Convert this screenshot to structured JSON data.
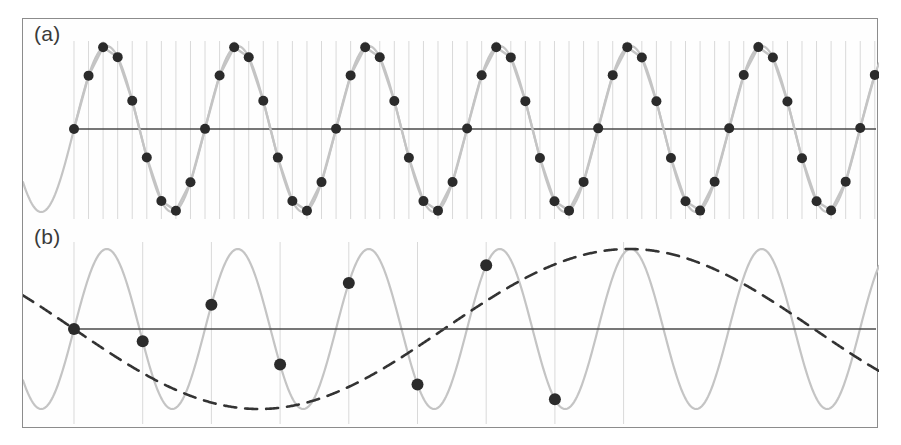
{
  "figure": {
    "width": 901,
    "height": 445,
    "background_color": "#ffffff",
    "frame_color": "#8c8c8c"
  },
  "panels": [
    {
      "id": "a",
      "label": "(a)",
      "description": "Adequately sampled sinusoid: dense sample grid, dots follow the underlying wave"
    },
    {
      "id": "b",
      "label": "(b)",
      "description": "Undersampled sinusoid: sparse sample grid, dots trace an aliased low-frequency dashed curve"
    }
  ],
  "style": {
    "signal_color": "#c4c4c4",
    "sample_dot_color": "#2b2b2b",
    "axis_color": "#4a4a4a",
    "gridline_color": "#d9d9d9",
    "alias_color": "#333333"
  },
  "chart_data": [
    {
      "type": "line",
      "title": "(a)",
      "xlabel": "",
      "ylabel": "",
      "grid": true,
      "legend": "none",
      "xlim": [
        0,
        856
      ],
      "ylim": [
        -1.25,
        1.25
      ],
      "axis_y": 0,
      "series": [
        {
          "name": "signal",
          "kind": "sinusoid",
          "amplitude": 1.0,
          "period_px": 131,
          "phase": 0,
          "color": "#c4c4c4",
          "style": "solid"
        },
        {
          "name": "samples",
          "kind": "scatter",
          "samples_per_period": 9,
          "sample_spacing_px": 14.56,
          "color": "#2b2b2b",
          "marker": "circle",
          "marker_radius_px": 5
        }
      ],
      "gridlines": {
        "orientation": "vertical",
        "spacing_px": 14.56,
        "count": 56,
        "color": "#d9d9d9",
        "top_px": 22,
        "bottom_px": 200
      }
    },
    {
      "type": "line",
      "title": "(b)",
      "xlabel": "",
      "ylabel": "",
      "grid": true,
      "legend": "none",
      "xlim": [
        0,
        856
      ],
      "ylim": [
        -1.25,
        1.25
      ],
      "axis_y": 0,
      "series": [
        {
          "name": "signal",
          "kind": "sinusoid",
          "amplitude": 1.0,
          "period_px": 131,
          "phase": 0,
          "color": "#c4c4c4",
          "style": "solid"
        },
        {
          "name": "alias",
          "kind": "sinusoid",
          "amplitude": 1.0,
          "period_px": 740,
          "phase": 3.14159,
          "color": "#333333",
          "style": "dashed"
        },
        {
          "name": "samples",
          "kind": "scatter",
          "sample_spacing_px": 68.7,
          "count": 8,
          "color": "#2b2b2b",
          "marker": "circle",
          "marker_radius_px": 6
        }
      ],
      "gridlines": {
        "orientation": "vertical",
        "spacing_px": 68.7,
        "count": 9,
        "color": "#d9d9d9",
        "top_px": 18,
        "bottom_px": 200
      }
    }
  ]
}
